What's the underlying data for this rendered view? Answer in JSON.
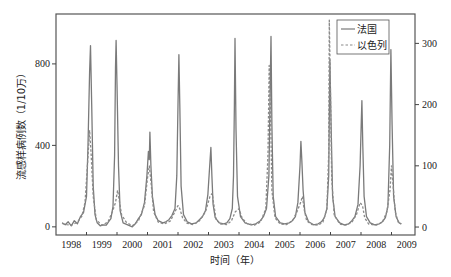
{
  "chart_data": {
    "type": "line",
    "title": "",
    "xlabel": "时间（年）",
    "ylabel_left": "流感样病例数（1/10万）",
    "ylabel_right": "",
    "x_tick_labels": [
      "1998",
      "1999",
      "2000",
      "2001",
      "2002",
      "2003",
      "2004",
      "2005",
      "2006",
      "2007",
      "2008",
      "2009"
    ],
    "xlim": [
      1998.0,
      2009.77
    ],
    "ylim_left": [
      -40,
      1045
    ],
    "ylim_right": [
      -13,
      348
    ],
    "y_ticks_left": [
      0,
      400,
      800
    ],
    "y_ticks_right": [
      0,
      100,
      200,
      300
    ],
    "grid": false,
    "legend": {
      "placement": "top-right",
      "entries": [
        {
          "label": "法国",
          "style": "solid"
        },
        {
          "label": "以色列",
          "style": "dashed"
        }
      ]
    },
    "series": [
      {
        "name": "法国",
        "axis": "left",
        "style": "solid",
        "color": "#7a7a7a",
        "points": [
          [
            1998.2,
            20
          ],
          [
            1998.3,
            10
          ],
          [
            1998.4,
            25
          ],
          [
            1998.5,
            5
          ],
          [
            1998.6,
            30
          ],
          [
            1998.7,
            15
          ],
          [
            1998.8,
            50
          ],
          [
            1998.9,
            70
          ],
          [
            1999.0,
            150
          ],
          [
            1999.05,
            400
          ],
          [
            1999.1,
            760
          ],
          [
            1999.13,
            890
          ],
          [
            1999.17,
            600
          ],
          [
            1999.22,
            200
          ],
          [
            1999.28,
            60
          ],
          [
            1999.35,
            20
          ],
          [
            1999.45,
            5
          ],
          [
            1999.55,
            10
          ],
          [
            1999.65,
            8
          ],
          [
            1999.72,
            25
          ],
          [
            1999.8,
            40
          ],
          [
            1999.87,
            100
          ],
          [
            1999.92,
            350
          ],
          [
            1999.95,
            780
          ],
          [
            1999.97,
            915
          ],
          [
            2000.0,
            700
          ],
          [
            2000.05,
            300
          ],
          [
            2000.1,
            80
          ],
          [
            2000.2,
            20
          ],
          [
            2000.35,
            10
          ],
          [
            2000.5,
            0
          ],
          [
            2000.6,
            15
          ],
          [
            2000.7,
            40
          ],
          [
            2000.8,
            60
          ],
          [
            2000.9,
            120
          ],
          [
            2000.98,
            250
          ],
          [
            2001.03,
            370
          ],
          [
            2001.06,
            330
          ],
          [
            2001.08,
            465
          ],
          [
            2001.11,
            300
          ],
          [
            2001.16,
            150
          ],
          [
            2001.25,
            60
          ],
          [
            2001.35,
            30
          ],
          [
            2001.5,
            20
          ],
          [
            2001.6,
            25
          ],
          [
            2001.7,
            35
          ],
          [
            2001.8,
            55
          ],
          [
            2001.9,
            90
          ],
          [
            2001.96,
            250
          ],
          [
            2002.0,
            600
          ],
          [
            2002.03,
            845
          ],
          [
            2002.06,
            600
          ],
          [
            2002.1,
            200
          ],
          [
            2002.18,
            60
          ],
          [
            2002.3,
            25
          ],
          [
            2002.45,
            15
          ],
          [
            2002.6,
            20
          ],
          [
            2002.7,
            35
          ],
          [
            2002.8,
            50
          ],
          [
            2002.9,
            80
          ],
          [
            2002.98,
            160
          ],
          [
            2003.04,
            300
          ],
          [
            2003.08,
            390
          ],
          [
            2003.11,
            250
          ],
          [
            2003.15,
            110
          ],
          [
            2003.22,
            45
          ],
          [
            2003.35,
            20
          ],
          [
            2003.5,
            15
          ],
          [
            2003.6,
            20
          ],
          [
            2003.7,
            40
          ],
          [
            2003.78,
            90
          ],
          [
            2003.82,
            250
          ],
          [
            2003.85,
            600
          ],
          [
            2003.87,
            925
          ],
          [
            2003.9,
            480
          ],
          [
            2003.95,
            150
          ],
          [
            2004.05,
            50
          ],
          [
            2004.2,
            20
          ],
          [
            2004.4,
            10
          ],
          [
            2004.55,
            15
          ],
          [
            2004.7,
            30
          ],
          [
            2004.8,
            50
          ],
          [
            2004.9,
            90
          ],
          [
            2004.98,
            250
          ],
          [
            2005.02,
            650
          ],
          [
            2005.05,
            935
          ],
          [
            2005.08,
            500
          ],
          [
            2005.12,
            150
          ],
          [
            2005.2,
            50
          ],
          [
            2005.35,
            20
          ],
          [
            2005.5,
            15
          ],
          [
            2005.65,
            20
          ],
          [
            2005.75,
            30
          ],
          [
            2005.85,
            50
          ],
          [
            2005.93,
            120
          ],
          [
            2006.0,
            300
          ],
          [
            2006.03,
            420
          ],
          [
            2006.06,
            330
          ],
          [
            2006.1,
            180
          ],
          [
            2006.16,
            70
          ],
          [
            2006.28,
            25
          ],
          [
            2006.45,
            10
          ],
          [
            2006.6,
            15
          ],
          [
            2006.7,
            25
          ],
          [
            2006.8,
            45
          ],
          [
            2006.88,
            90
          ],
          [
            2006.94,
            250
          ],
          [
            2006.98,
            820
          ],
          [
            2007.02,
            500
          ],
          [
            2007.07,
            150
          ],
          [
            2007.15,
            50
          ],
          [
            2007.3,
            20
          ],
          [
            2007.45,
            10
          ],
          [
            2007.6,
            15
          ],
          [
            2007.7,
            30
          ],
          [
            2007.8,
            50
          ],
          [
            2007.9,
            110
          ],
          [
            2007.97,
            300
          ],
          [
            2008.01,
            520
          ],
          [
            2008.03,
            620
          ],
          [
            2008.06,
            400
          ],
          [
            2008.1,
            150
          ],
          [
            2008.18,
            50
          ],
          [
            2008.3,
            20
          ],
          [
            2008.45,
            10
          ],
          [
            2008.6,
            15
          ],
          [
            2008.7,
            25
          ],
          [
            2008.8,
            45
          ],
          [
            2008.88,
            100
          ],
          [
            2008.94,
            400
          ],
          [
            2008.98,
            870
          ],
          [
            2009.02,
            500
          ],
          [
            2009.07,
            150
          ],
          [
            2009.15,
            50
          ],
          [
            2009.25,
            20
          ],
          [
            2009.32,
            15
          ]
        ]
      },
      {
        "name": "以色列",
        "axis": "right",
        "style": "dashed",
        "color": "#8a8a8a",
        "points": [
          [
            1998.2,
            6
          ],
          [
            1998.35,
            4
          ],
          [
            1998.5,
            3
          ],
          [
            1998.7,
            8
          ],
          [
            1998.85,
            18
          ],
          [
            1998.95,
            40
          ],
          [
            1999.03,
            100
          ],
          [
            1999.1,
            158
          ],
          [
            1999.15,
            120
          ],
          [
            1999.22,
            50
          ],
          [
            1999.32,
            12
          ],
          [
            1999.5,
            3
          ],
          [
            1999.7,
            8
          ],
          [
            1999.85,
            25
          ],
          [
            1999.95,
            40
          ],
          [
            2000.02,
            60
          ],
          [
            2000.07,
            45
          ],
          [
            2000.15,
            20
          ],
          [
            2000.3,
            8
          ],
          [
            2000.5,
            2
          ],
          [
            2000.7,
            10
          ],
          [
            2000.9,
            35
          ],
          [
            2001.0,
            80
          ],
          [
            2001.06,
            100
          ],
          [
            2001.12,
            70
          ],
          [
            2001.2,
            25
          ],
          [
            2001.35,
            8
          ],
          [
            2001.55,
            5
          ],
          [
            2001.75,
            10
          ],
          [
            2001.9,
            25
          ],
          [
            2002.0,
            35
          ],
          [
            2002.06,
            30
          ],
          [
            2002.15,
            15
          ],
          [
            2002.3,
            6
          ],
          [
            2002.5,
            4
          ],
          [
            2002.7,
            10
          ],
          [
            2002.9,
            25
          ],
          [
            2003.05,
            50
          ],
          [
            2003.12,
            55
          ],
          [
            2003.18,
            35
          ],
          [
            2003.25,
            12
          ],
          [
            2003.4,
            5
          ],
          [
            2003.6,
            4
          ],
          [
            2003.75,
            10
          ],
          [
            2003.88,
            25
          ],
          [
            2004.0,
            30
          ],
          [
            2004.1,
            15
          ],
          [
            2004.25,
            6
          ],
          [
            2004.5,
            3
          ],
          [
            2004.7,
            8
          ],
          [
            2004.88,
            30
          ],
          [
            2004.95,
            120
          ],
          [
            2004.99,
            264
          ],
          [
            2005.03,
            200
          ],
          [
            2005.08,
            60
          ],
          [
            2005.18,
            15
          ],
          [
            2005.35,
            5
          ],
          [
            2005.55,
            4
          ],
          [
            2005.75,
            10
          ],
          [
            2005.9,
            25
          ],
          [
            2006.02,
            40
          ],
          [
            2006.08,
            50
          ],
          [
            2006.13,
            30
          ],
          [
            2006.22,
            10
          ],
          [
            2006.4,
            4
          ],
          [
            2006.6,
            3
          ],
          [
            2006.75,
            8
          ],
          [
            2006.88,
            30
          ],
          [
            2006.94,
            120
          ],
          [
            2006.96,
            338
          ],
          [
            2006.99,
            250
          ],
          [
            2007.04,
            80
          ],
          [
            2007.12,
            20
          ],
          [
            2007.3,
            5
          ],
          [
            2007.5,
            3
          ],
          [
            2007.7,
            8
          ],
          [
            2007.85,
            20
          ],
          [
            2007.97,
            40
          ],
          [
            2008.05,
            35
          ],
          [
            2008.12,
            15
          ],
          [
            2008.25,
            5
          ],
          [
            2008.5,
            3
          ],
          [
            2008.7,
            8
          ],
          [
            2008.85,
            25
          ],
          [
            2008.95,
            60
          ],
          [
            2009.0,
            100
          ],
          [
            2009.05,
            70
          ],
          [
            2009.12,
            25
          ],
          [
            2009.22,
            8
          ],
          [
            2009.32,
            5
          ]
        ]
      }
    ]
  }
}
